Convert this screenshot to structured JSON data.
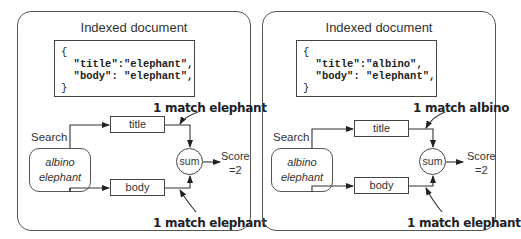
{
  "panels": [
    {
      "title": "Indexed document",
      "code": {
        "open": "{",
        "title_line": "  \"title\":\"elephant\",",
        "body_line": "  \"body\": \"elephant\",",
        "close": "}"
      },
      "search_label": "Search",
      "query": {
        "line1": "albino",
        "line2": "elephant"
      },
      "fields": {
        "title": "title",
        "body": "body"
      },
      "sum_label": "sum",
      "score": {
        "line1": "Score",
        "line2": "=2"
      },
      "annotations": {
        "title_match": "1 match elephant",
        "body_match": "1 match elephant"
      }
    },
    {
      "title": "Indexed document",
      "code": {
        "open": "{",
        "title_line": "  \"title\":\"albino\",",
        "body_line": "  \"body\": \"elephant\",",
        "close": "}"
      },
      "search_label": "Search",
      "query": {
        "line1": "albino",
        "line2": "elephant"
      },
      "fields": {
        "title": "title",
        "body": "body"
      },
      "sum_label": "sum",
      "score": {
        "line1": "Score",
        "line2": "=2"
      },
      "annotations": {
        "title_match": "1 match albino",
        "body_match": "1 match elephant"
      }
    }
  ]
}
